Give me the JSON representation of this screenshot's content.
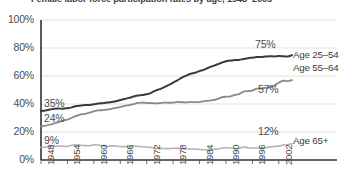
{
  "chart_data": {
    "type": "line",
    "title": "Female labor force participation rates by age, 1948–2005",
    "xlabel": "",
    "ylabel": "",
    "ylim": [
      0,
      100
    ],
    "xlim": [
      1948,
      2005
    ],
    "grid": true,
    "legend_position": "right-inline",
    "ytick_labels": [
      "100%",
      "80%",
      "60%",
      "40%",
      "20%",
      "0%"
    ],
    "ytick_values": [
      100,
      80,
      60,
      40,
      20,
      0
    ],
    "xtick_labels": [
      "1948",
      "1954",
      "1960",
      "1966",
      "1972",
      "1978",
      "1984",
      "1990",
      "1996",
      "2002"
    ],
    "xtick_values": [
      1948,
      1954,
      1960,
      1966,
      1972,
      1978,
      1984,
      1990,
      1996,
      2002
    ],
    "x": [
      1948,
      1949,
      1950,
      1951,
      1952,
      1953,
      1954,
      1955,
      1956,
      1957,
      1958,
      1959,
      1960,
      1961,
      1962,
      1963,
      1964,
      1965,
      1966,
      1967,
      1968,
      1969,
      1970,
      1971,
      1972,
      1973,
      1974,
      1975,
      1976,
      1977,
      1978,
      1979,
      1980,
      1981,
      1982,
      1983,
      1984,
      1985,
      1986,
      1987,
      1988,
      1989,
      1990,
      1991,
      1992,
      1993,
      1994,
      1995,
      1996,
      1997,
      1998,
      1999,
      2000,
      2001,
      2002,
      2003,
      2004,
      2005
    ],
    "series": [
      {
        "name": "Age 25–54",
        "color": "#3a3a3a",
        "start_value_label": "35%",
        "end_value_label": "75%",
        "values": [
          35.0,
          35.3,
          36.0,
          36.6,
          36.8,
          36.6,
          37.0,
          37.6,
          38.5,
          38.9,
          39.2,
          39.3,
          39.8,
          40.4,
          40.6,
          41.0,
          41.4,
          42.0,
          42.8,
          43.6,
          44.4,
          45.3,
          46.1,
          46.4,
          46.9,
          48.0,
          49.6,
          50.6,
          52.0,
          53.6,
          55.3,
          56.9,
          58.9,
          60.3,
          61.6,
          62.3,
          63.5,
          64.4,
          65.9,
          67.1,
          68.2,
          69.5,
          70.6,
          71.0,
          71.4,
          71.5,
          72.2,
          72.7,
          73.1,
          73.5,
          73.6,
          73.9,
          74.1,
          74.0,
          74.2,
          74.1,
          73.9,
          74.9
        ]
      },
      {
        "name": "Age 55–64",
        "color": "#8a8a8a",
        "start_value_label": "24%",
        "end_value_label": "57%",
        "values": [
          24.0,
          24.5,
          25.3,
          26.2,
          27.1,
          28.2,
          28.8,
          30.2,
          31.5,
          32.6,
          33.0,
          33.8,
          34.8,
          35.4,
          35.6,
          36.0,
          36.6,
          37.2,
          38.0,
          38.7,
          39.2,
          39.9,
          40.8,
          41.0,
          40.8,
          40.6,
          40.5,
          40.6,
          41.0,
          40.9,
          41.0,
          41.5,
          41.3,
          41.2,
          41.5,
          41.3,
          41.5,
          42.0,
          42.3,
          42.7,
          43.5,
          44.7,
          45.2,
          45.4,
          46.5,
          47.1,
          48.9,
          49.2,
          49.6,
          50.9,
          51.2,
          51.5,
          51.9,
          53.2,
          55.2,
          56.6,
          56.3,
          57.0
        ]
      },
      {
        "name": "Age 65+",
        "color": "#b3b3b3",
        "start_value_label": "9%",
        "end_value_label": "12%",
        "values": [
          9.0,
          9.3,
          9.7,
          9.9,
          9.8,
          10.0,
          9.7,
          10.5,
          10.8,
          10.5,
          10.3,
          10.2,
          10.8,
          10.7,
          10.0,
          9.6,
          10.1,
          10.0,
          9.6,
          9.6,
          9.6,
          9.9,
          9.7,
          9.5,
          9.3,
          8.9,
          8.2,
          8.3,
          8.2,
          8.1,
          8.4,
          8.3,
          8.1,
          8.0,
          7.9,
          7.8,
          7.5,
          7.3,
          7.4,
          7.4,
          7.9,
          8.4,
          8.7,
          8.6,
          8.3,
          8.2,
          9.2,
          8.8,
          8.6,
          8.6,
          8.6,
          8.9,
          9.4,
          9.7,
          9.9,
          10.6,
          11.1,
          11.5
        ]
      }
    ]
  },
  "axis": {
    "ytick_0": "100%",
    "ytick_1": "80%",
    "ytick_2": "60%",
    "ytick_3": "40%",
    "ytick_4": "20%",
    "ytick_5": "0%"
  },
  "labels": {
    "start_25_54": "35%",
    "start_55_64": "24%",
    "start_65": "9%",
    "end_25_54": "75%",
    "end_55_64": "57%",
    "end_65": "12%",
    "legend_25_54": "Age 25–54",
    "legend_55_64": "Age 55–64",
    "legend_65": "Age 65+"
  }
}
